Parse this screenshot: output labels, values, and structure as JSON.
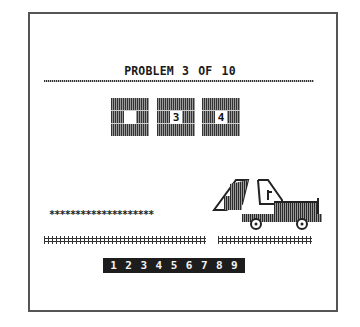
{
  "screen": {
    "title_word": "PROBLEM",
    "title_progress": "3 OF 10",
    "current_problem": 3,
    "total_problems": 10
  },
  "sequence": {
    "blocks": [
      {
        "value": "",
        "is_blank": true
      },
      {
        "value": "3",
        "is_blank": false
      },
      {
        "value": "4",
        "is_blank": false
      }
    ]
  },
  "scene": {
    "asterisk_trail": "********************",
    "asterisk_count": 20,
    "vehicle": "dump-truck"
  },
  "answer_bar": {
    "digits": [
      "1",
      "2",
      "3",
      "4",
      "5",
      "6",
      "7",
      "8",
      "9"
    ]
  },
  "colors": {
    "background": "#ffffff",
    "ink": "#1d1d1d",
    "frame": "#555555"
  }
}
